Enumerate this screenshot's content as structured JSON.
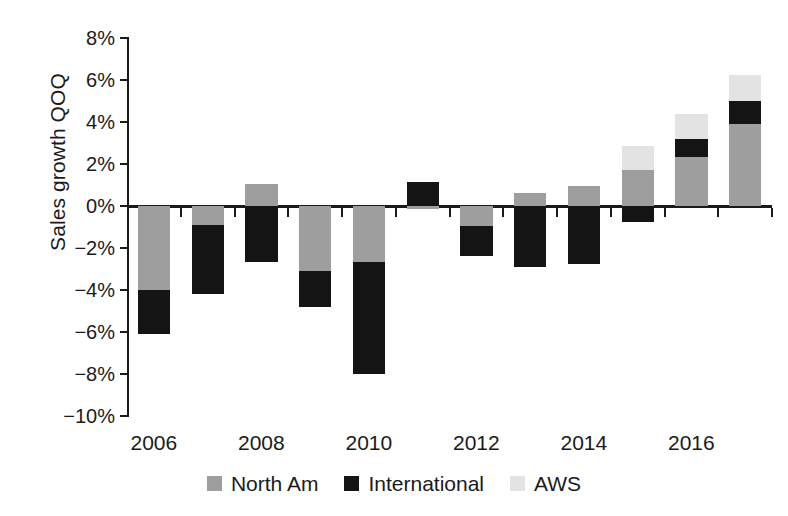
{
  "chart_data": {
    "type": "bar",
    "subtype": "stacked-bar-with-negatives",
    "title": "",
    "xlabel": "",
    "ylabel": "Sales growth QOQ",
    "ylim": [
      -10,
      8
    ],
    "ytick_values": [
      8,
      6,
      4,
      2,
      0,
      -2,
      -4,
      -6,
      -8,
      -10
    ],
    "ytick_labels": [
      "8%",
      "6%",
      "4%",
      "2%",
      "0%",
      "-2%",
      "-4%",
      "-6%",
      "-8%",
      "-10%"
    ],
    "grid": false,
    "legend_position": "bottom",
    "x": [
      2006,
      2007,
      2008,
      2009,
      2010,
      2011,
      2012,
      2013,
      2014,
      2015,
      2016,
      2017
    ],
    "xtick_labels": [
      "2006",
      "2008",
      "2010",
      "2012",
      "2014",
      "2016"
    ],
    "xtick_values": [
      2006,
      2008,
      2010,
      2012,
      2014,
      2016
    ],
    "series": [
      {
        "name": "North Am",
        "color": "#9e9e9e",
        "values": [
          -4.0,
          -0.9,
          1.05,
          -3.1,
          -2.65,
          -0.15,
          -0.95,
          0.6,
          0.95,
          1.7,
          2.35,
          3.9
        ]
      },
      {
        "name": "International",
        "color": "#141414",
        "values": [
          -2.1,
          -3.3,
          -2.65,
          -1.7,
          -5.35,
          1.15,
          -1.45,
          -2.9,
          -2.75,
          -0.75,
          0.85,
          1.1
        ]
      },
      {
        "name": "AWS",
        "color": "#e3e3e3",
        "values": [
          0,
          0,
          0,
          0,
          0,
          0,
          0,
          0,
          0,
          1.15,
          1.2,
          1.25
        ]
      }
    ],
    "stack_totals_negative": [
      -6.1,
      -4.2,
      -2.65,
      -4.8,
      -8.0,
      -0.15,
      -2.4,
      -2.9,
      -2.75,
      -0.75,
      0,
      0
    ],
    "stack_totals_positive": [
      0,
      0,
      1.05,
      0,
      0,
      1.15,
      0,
      0.6,
      0.95,
      2.85,
      4.4,
      6.25
    ]
  },
  "legend": {
    "items": [
      {
        "label": "North Am",
        "color": "#9e9e9e"
      },
      {
        "label": "International",
        "color": "#141414"
      },
      {
        "label": "AWS",
        "color": "#e3e3e3"
      }
    ]
  }
}
